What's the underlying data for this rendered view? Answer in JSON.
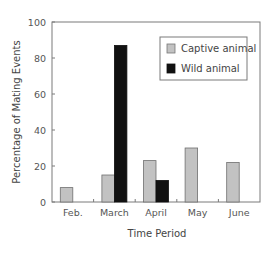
{
  "chart_data": {
    "type": "bar",
    "title": "",
    "xlabel": "Time Period",
    "ylabel": "Percentage of Mating Events",
    "categories": [
      "Feb.",
      "March",
      "April",
      "May",
      "June"
    ],
    "series": [
      {
        "name": "Captive animal",
        "color": "#c2c2c2",
        "values": [
          8,
          15,
          23,
          30,
          22
        ]
      },
      {
        "name": "Wild animal",
        "color": "#111111",
        "values": [
          0,
          87,
          12,
          0,
          0
        ]
      }
    ],
    "yticks": [
      0,
      20,
      40,
      60,
      80,
      100
    ],
    "ylim": [
      0,
      100
    ],
    "grid": false,
    "legend_position": "upper right"
  },
  "legend": {
    "items": [
      {
        "label": "Captive animal",
        "color": "#c2c2c2"
      },
      {
        "label": "Wild animal",
        "color": "#111111"
      }
    ]
  },
  "axes": {
    "xlabel": "Time Period",
    "ylabel": "Percentage of Mating Events"
  }
}
